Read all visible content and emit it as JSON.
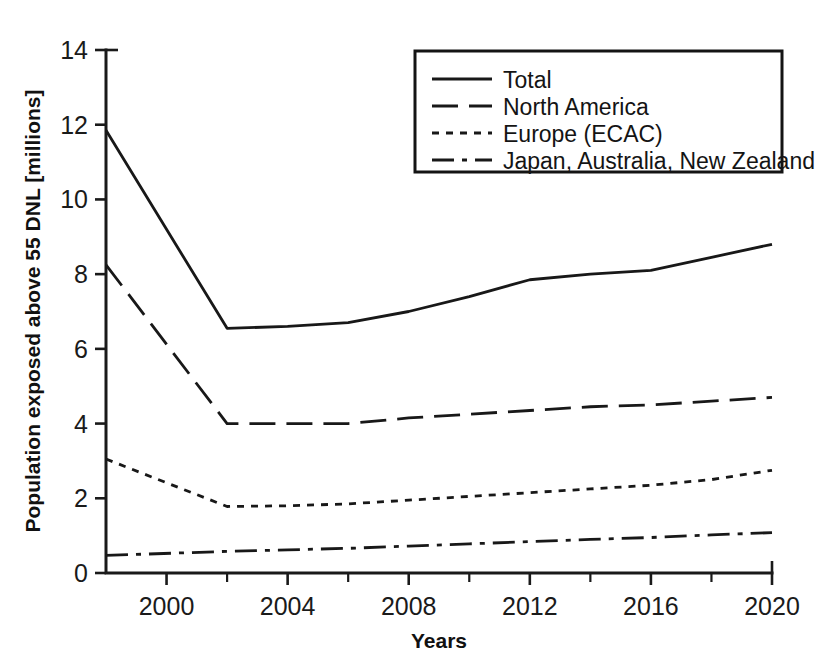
{
  "chart_data": {
    "type": "line",
    "title": "",
    "xlabel": "Years",
    "ylabel": "Population exposed above 55 DNL [millions]",
    "xlim": [
      1998,
      2020
    ],
    "ylim": [
      0,
      14
    ],
    "xticks": [
      2000,
      2004,
      2008,
      2012,
      2016,
      2020
    ],
    "xtick_labels": [
      "2000",
      "2004",
      "2008",
      "2012",
      "2016",
      "2020"
    ],
    "xminor_ticks": [
      2002,
      2006,
      2010,
      2014,
      2018
    ],
    "yticks": [
      0,
      2,
      4,
      6,
      8,
      10,
      12,
      14
    ],
    "ytick_labels": [
      "0",
      "2",
      "4",
      "6",
      "8",
      "10",
      "12",
      "14"
    ],
    "grid": false,
    "legend_position": "top-right",
    "x": [
      1998,
      2002,
      2004,
      2006,
      2008,
      2010,
      2012,
      2014,
      2016,
      2018,
      2020
    ],
    "series": [
      {
        "name": "Total",
        "style": "solid",
        "values": [
          11.85,
          6.55,
          6.6,
          6.7,
          7.0,
          7.4,
          7.85,
          8.0,
          8.1,
          8.45,
          8.8
        ]
      },
      {
        "name": "North America",
        "style": "dashed",
        "values": [
          8.25,
          4.0,
          4.0,
          4.0,
          4.15,
          4.25,
          4.35,
          4.45,
          4.5,
          4.6,
          4.7
        ]
      },
      {
        "name": "Europe (ECAC)",
        "style": "dotted",
        "values": [
          3.05,
          1.78,
          1.8,
          1.85,
          1.95,
          2.05,
          2.15,
          2.25,
          2.35,
          2.5,
          2.75
        ]
      },
      {
        "name": "Japan, Australia, New Zealand",
        "style": "dashdot",
        "values": [
          0.47,
          0.58,
          0.62,
          0.66,
          0.72,
          0.78,
          0.84,
          0.9,
          0.95,
          1.02,
          1.08
        ]
      }
    ]
  },
  "legend": {
    "items": [
      {
        "label": "Total"
      },
      {
        "label": "North America"
      },
      {
        "label": "Europe (ECAC)"
      },
      {
        "label": "Japan, Australia, New Zealand"
      }
    ]
  },
  "colors": {
    "line": "#181818",
    "axis": "#1a1a1a",
    "background": "#ffffff"
  }
}
